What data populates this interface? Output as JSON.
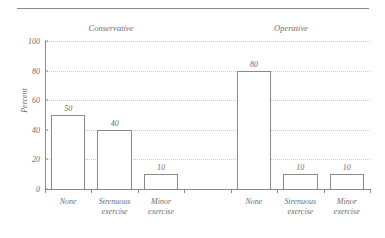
{
  "chart_data": {
    "type": "bar",
    "title": "",
    "subtitle": "",
    "xlabel": "",
    "ylabel": "Percent",
    "ylim": [
      0,
      100
    ],
    "yticks": [
      0,
      20,
      40,
      60,
      80,
      100
    ],
    "grid": true,
    "legend": false,
    "legend_position": "none",
    "group_headers": [
      "Conservative",
      "Operative"
    ],
    "categories": [
      "None",
      "Strenuous exercise",
      "Minor exercise"
    ],
    "series": [
      {
        "name": "Conservative",
        "values": [
          50,
          40,
          10
        ]
      },
      {
        "name": "Operative",
        "values": [
          80,
          10,
          10
        ]
      }
    ],
    "bars": [
      {
        "group": "Conservative",
        "category": "None",
        "category_line1": "None",
        "category_line2": "",
        "value": 50,
        "label": "50"
      },
      {
        "group": "Conservative",
        "category": "Strenuous exercise",
        "category_line1": "Strenuous",
        "category_line2": "exercise",
        "value": 40,
        "label": "40"
      },
      {
        "group": "Conservative",
        "category": "Minor exercise",
        "category_line1": "Minor",
        "category_line2": "exercise",
        "value": 10,
        "label": "10"
      },
      {
        "group": "Operative",
        "category": "None",
        "category_line1": "None",
        "category_line2": "",
        "value": 80,
        "label": "80"
      },
      {
        "group": "Operative",
        "category": "Strenuous exercise",
        "category_line1": "Strenuous",
        "category_line2": "exercise",
        "value": 10,
        "label": "10"
      },
      {
        "group": "Operative",
        "category": "Minor exercise",
        "category_line1": "Minor",
        "category_line2": "exercise",
        "value": 10,
        "label": "10"
      }
    ],
    "ytick_labels": [
      "0",
      "20",
      "40",
      "60",
      "80",
      "100"
    ],
    "colors": {
      "bar_fill": "#ffffff",
      "bar_stroke": "#8a8a8a",
      "axis": "#8a8a8a",
      "grid": "#c9c9c9",
      "text": "#6e6e6e",
      "background": "#ffffff"
    }
  }
}
